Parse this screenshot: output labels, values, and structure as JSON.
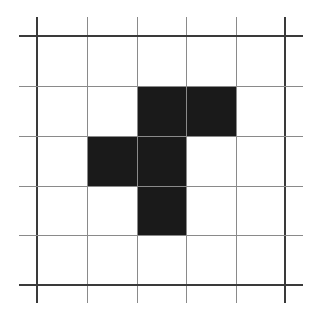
{
  "diagram": {
    "type": "grid-pattern",
    "rows": 5,
    "cols": 5,
    "grid_x": [
      37,
      87,
      137,
      186,
      236,
      285
    ],
    "grid_y": [
      36,
      86,
      136,
      186,
      235,
      285
    ],
    "line_extent": {
      "x_min": 19,
      "x_max": 303,
      "y_min": 17,
      "y_max": 303
    },
    "filled_color": "#1a1a1a",
    "line_color": "#8a8a8a",
    "border_line_color": "#3a3a3a",
    "filled_cells": [
      {
        "col": 2,
        "row": 1
      },
      {
        "col": 3,
        "row": 1
      },
      {
        "col": 1,
        "row": 2
      },
      {
        "col": 2,
        "row": 2
      },
      {
        "col": 2,
        "row": 3
      }
    ]
  }
}
